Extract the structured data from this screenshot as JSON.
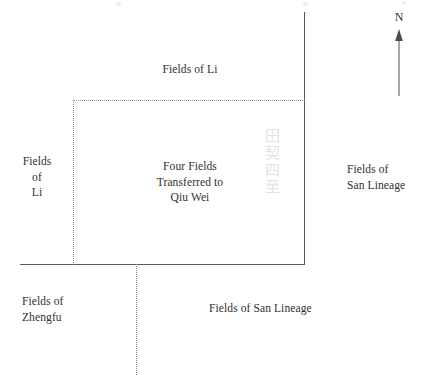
{
  "diagram": {
    "compass": {
      "direction_label": "N",
      "icon": "north-arrow-icon"
    },
    "labels": {
      "top_field": "Fields of Li",
      "left_field": "Fields\nof\nLi",
      "center_plot": "Four Fields\nTransferred to\nQiu Wei",
      "right_field": "Fields of\nSan Lineage",
      "bottom_left_field": "Fields of\nZhengfu",
      "bottom_field": "Fields of San Lineage"
    },
    "colors": {
      "background": "#ffffff",
      "solid_stroke": "#5a5a5a",
      "dotted_stroke": "#8e8e8e",
      "text": "#2f2f2f",
      "bleed_through": "#c9ccd2"
    },
    "artifacts": {
      "bleed_text": "田契四至"
    }
  }
}
